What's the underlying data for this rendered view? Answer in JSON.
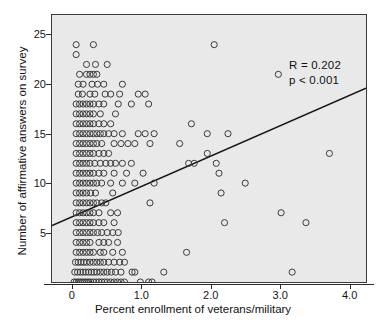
{
  "chart_data": {
    "type": "scatter",
    "title": "",
    "xlabel": "Percent enrollment of veterans/military",
    "ylabel": "Number of affirmative answers on survey",
    "xlim": [
      -0.3,
      4.25
    ],
    "ylim": [
      0,
      27
    ],
    "xticks": [
      0,
      1.0,
      2.0,
      3.0,
      4.0
    ],
    "xtick_labels": [
      "0",
      "1.0",
      "2.0",
      "3.0",
      "4.0"
    ],
    "yticks": [
      5,
      10,
      15,
      20,
      25
    ],
    "ytick_labels": [
      "5",
      "10",
      "15",
      "20",
      "25"
    ],
    "grid": false,
    "legend": null,
    "background_color": "#e9e9e9",
    "marker": "open-circle",
    "marker_color": "#3a3a3a",
    "annotations": [
      {
        "text": "R = 0.202",
        "x": 3.1,
        "y": 21.5
      },
      {
        "text": "p < 0.001",
        "x": 3.1,
        "y": 20.0
      }
    ],
    "statistics": {
      "correlation_label": "R = 0.202",
      "pvalue_label": "p < 0.001",
      "r": 0.202,
      "p": 0.001
    },
    "regression_line": {
      "x_start": -0.3,
      "y_start": 5.7,
      "x_end": 4.25,
      "y_end": 19.6,
      "slope": 3.05,
      "intercept": 6.62,
      "color": "#141414"
    },
    "points": [
      [
        0.05,
        24
      ],
      [
        0.3,
        24
      ],
      [
        0.05,
        23
      ],
      [
        0.2,
        22
      ],
      [
        0.33,
        22
      ],
      [
        0.5,
        22
      ],
      [
        0.1,
        21
      ],
      [
        0.2,
        21
      ],
      [
        0.25,
        21
      ],
      [
        0.3,
        21
      ],
      [
        0.35,
        21
      ],
      [
        0.08,
        20
      ],
      [
        0.15,
        20
      ],
      [
        0.28,
        20
      ],
      [
        0.36,
        20
      ],
      [
        0.45,
        20
      ],
      [
        0.72,
        20
      ],
      [
        0.08,
        19
      ],
      [
        0.14,
        19
      ],
      [
        0.25,
        19
      ],
      [
        0.32,
        19
      ],
      [
        0.47,
        19
      ],
      [
        0.55,
        19
      ],
      [
        0.68,
        19
      ],
      [
        0.95,
        19
      ],
      [
        1.05,
        19
      ],
      [
        0.05,
        18
      ],
      [
        0.1,
        18
      ],
      [
        0.15,
        18
      ],
      [
        0.2,
        18
      ],
      [
        0.25,
        18
      ],
      [
        0.3,
        18
      ],
      [
        0.38,
        18
      ],
      [
        0.45,
        18
      ],
      [
        0.66,
        18
      ],
      [
        0.85,
        18
      ],
      [
        1.1,
        18
      ],
      [
        0.05,
        17
      ],
      [
        0.1,
        17
      ],
      [
        0.15,
        17
      ],
      [
        0.2,
        17
      ],
      [
        0.25,
        17
      ],
      [
        0.3,
        17
      ],
      [
        0.4,
        17
      ],
      [
        0.62,
        17
      ],
      [
        0.05,
        16
      ],
      [
        0.1,
        16
      ],
      [
        0.15,
        16
      ],
      [
        0.2,
        16
      ],
      [
        0.25,
        16
      ],
      [
        0.3,
        16
      ],
      [
        0.38,
        16
      ],
      [
        0.45,
        16
      ],
      [
        0.55,
        16
      ],
      [
        1.72,
        16
      ],
      [
        0.05,
        15
      ],
      [
        0.1,
        15
      ],
      [
        0.15,
        15
      ],
      [
        0.2,
        15
      ],
      [
        0.25,
        15
      ],
      [
        0.3,
        15
      ],
      [
        0.35,
        15
      ],
      [
        0.4,
        15
      ],
      [
        0.45,
        15
      ],
      [
        0.52,
        15
      ],
      [
        0.6,
        15
      ],
      [
        0.72,
        15
      ],
      [
        0.95,
        15
      ],
      [
        1.05,
        15
      ],
      [
        1.18,
        15
      ],
      [
        1.95,
        15
      ],
      [
        2.25,
        15
      ],
      [
        0.05,
        14
      ],
      [
        0.1,
        14
      ],
      [
        0.15,
        14
      ],
      [
        0.2,
        14
      ],
      [
        0.25,
        14
      ],
      [
        0.3,
        14
      ],
      [
        0.35,
        14
      ],
      [
        0.42,
        14
      ],
      [
        0.6,
        14
      ],
      [
        0.7,
        14
      ],
      [
        0.8,
        14
      ],
      [
        0.9,
        14
      ],
      [
        1.12,
        14
      ],
      [
        1.55,
        14
      ],
      [
        0.05,
        13
      ],
      [
        0.1,
        13
      ],
      [
        0.15,
        13
      ],
      [
        0.2,
        13
      ],
      [
        0.25,
        13
      ],
      [
        0.3,
        13
      ],
      [
        0.38,
        13
      ],
      [
        0.45,
        13
      ],
      [
        0.52,
        13
      ],
      [
        1.95,
        13
      ],
      [
        3.72,
        13
      ],
      [
        0.05,
        12
      ],
      [
        0.1,
        12
      ],
      [
        0.15,
        12
      ],
      [
        0.2,
        12
      ],
      [
        0.25,
        12
      ],
      [
        0.32,
        12
      ],
      [
        0.4,
        12
      ],
      [
        0.48,
        12
      ],
      [
        0.55,
        12
      ],
      [
        0.62,
        12
      ],
      [
        0.72,
        12
      ],
      [
        0.85,
        12
      ],
      [
        1.68,
        12
      ],
      [
        1.76,
        12
      ],
      [
        2.08,
        12
      ],
      [
        0.05,
        11
      ],
      [
        0.1,
        11
      ],
      [
        0.15,
        11
      ],
      [
        0.2,
        11
      ],
      [
        0.25,
        11
      ],
      [
        0.3,
        11
      ],
      [
        0.38,
        11
      ],
      [
        0.45,
        11
      ],
      [
        0.6,
        11
      ],
      [
        0.78,
        11
      ],
      [
        1.02,
        11
      ],
      [
        2.12,
        11
      ],
      [
        0.05,
        10
      ],
      [
        0.1,
        10
      ],
      [
        0.15,
        10
      ],
      [
        0.2,
        10
      ],
      [
        0.25,
        10
      ],
      [
        0.3,
        10
      ],
      [
        0.35,
        10
      ],
      [
        0.42,
        10
      ],
      [
        0.55,
        10
      ],
      [
        0.72,
        10
      ],
      [
        0.9,
        10
      ],
      [
        1.18,
        10
      ],
      [
        2.5,
        10
      ],
      [
        0.05,
        9
      ],
      [
        0.1,
        9
      ],
      [
        0.15,
        9
      ],
      [
        0.2,
        9
      ],
      [
        0.26,
        9
      ],
      [
        0.33,
        9
      ],
      [
        0.58,
        9
      ],
      [
        2.15,
        9
      ],
      [
        0.05,
        8
      ],
      [
        0.1,
        8
      ],
      [
        0.15,
        8
      ],
      [
        0.2,
        8
      ],
      [
        0.25,
        8
      ],
      [
        0.3,
        8
      ],
      [
        0.35,
        8
      ],
      [
        0.42,
        8
      ],
      [
        0.48,
        8
      ],
      [
        1.12,
        8
      ],
      [
        0.05,
        7
      ],
      [
        0.1,
        7
      ],
      [
        0.15,
        7
      ],
      [
        0.2,
        7
      ],
      [
        0.25,
        7
      ],
      [
        0.3,
        7
      ],
      [
        0.38,
        7
      ],
      [
        0.55,
        7
      ],
      [
        0.65,
        7
      ],
      [
        3.02,
        7
      ],
      [
        0.05,
        6
      ],
      [
        0.1,
        6
      ],
      [
        0.15,
        6
      ],
      [
        0.2,
        6
      ],
      [
        0.25,
        6
      ],
      [
        0.3,
        6
      ],
      [
        0.38,
        6
      ],
      [
        0.45,
        6
      ],
      [
        0.6,
        6
      ],
      [
        2.2,
        6
      ],
      [
        3.38,
        6
      ],
      [
        0.05,
        5
      ],
      [
        0.1,
        5
      ],
      [
        0.15,
        5
      ],
      [
        0.2,
        5
      ],
      [
        0.25,
        5
      ],
      [
        0.3,
        5
      ],
      [
        0.36,
        5
      ],
      [
        0.42,
        5
      ],
      [
        0.5,
        5
      ],
      [
        0.58,
        5
      ],
      [
        0.66,
        5
      ],
      [
        0.05,
        4
      ],
      [
        0.1,
        4
      ],
      [
        0.15,
        4
      ],
      [
        0.2,
        4
      ],
      [
        0.25,
        4
      ],
      [
        0.38,
        4
      ],
      [
        0.45,
        4
      ],
      [
        0.52,
        4
      ],
      [
        0.65,
        4
      ],
      [
        0.05,
        3
      ],
      [
        0.1,
        3
      ],
      [
        0.15,
        3
      ],
      [
        0.2,
        3
      ],
      [
        0.25,
        3
      ],
      [
        0.3,
        3
      ],
      [
        0.4,
        3
      ],
      [
        0.45,
        3
      ],
      [
        0.58,
        3
      ],
      [
        0.72,
        3
      ],
      [
        1.65,
        3
      ],
      [
        0.04,
        2
      ],
      [
        0.08,
        2
      ],
      [
        0.12,
        2
      ],
      [
        0.16,
        2
      ],
      [
        0.2,
        2
      ],
      [
        0.25,
        2
      ],
      [
        0.3,
        2
      ],
      [
        0.35,
        2
      ],
      [
        0.4,
        2
      ],
      [
        0.45,
        2
      ],
      [
        0.52,
        2
      ],
      [
        0.6,
        2
      ],
      [
        0.68,
        2
      ],
      [
        0.75,
        2
      ],
      [
        0.03,
        1
      ],
      [
        0.07,
        1
      ],
      [
        0.11,
        1
      ],
      [
        0.15,
        1
      ],
      [
        0.19,
        1
      ],
      [
        0.23,
        1
      ],
      [
        0.27,
        1
      ],
      [
        0.31,
        1
      ],
      [
        0.35,
        1
      ],
      [
        0.4,
        1
      ],
      [
        0.45,
        1
      ],
      [
        0.5,
        1
      ],
      [
        0.56,
        1
      ],
      [
        0.62,
        1
      ],
      [
        0.7,
        1
      ],
      [
        0.86,
        1
      ],
      [
        0.9,
        1
      ],
      [
        1.32,
        1
      ],
      [
        3.18,
        1
      ],
      [
        0.02,
        0
      ],
      [
        0.05,
        0
      ],
      [
        0.08,
        0
      ],
      [
        0.11,
        0
      ],
      [
        0.14,
        0
      ],
      [
        0.17,
        0
      ],
      [
        0.2,
        0
      ],
      [
        0.23,
        0
      ],
      [
        0.26,
        0
      ],
      [
        0.3,
        0
      ],
      [
        0.34,
        0
      ],
      [
        0.38,
        0
      ],
      [
        0.42,
        0
      ],
      [
        0.46,
        0
      ],
      [
        0.5,
        0
      ],
      [
        0.55,
        0
      ],
      [
        0.6,
        0
      ],
      [
        0.65,
        0
      ],
      [
        0.7,
        0
      ],
      [
        0.75,
        0
      ],
      [
        0.98,
        0
      ],
      [
        1.1,
        0
      ],
      [
        1.15,
        0
      ],
      [
        2.05,
        24
      ],
      [
        2.98,
        21
      ]
    ]
  }
}
